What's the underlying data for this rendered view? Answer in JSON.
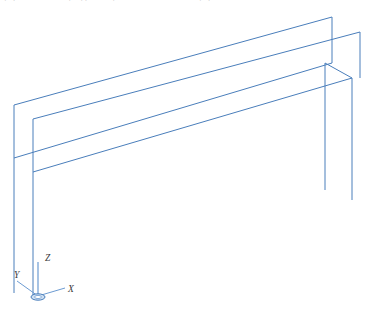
{
  "caption": {
    "text": "图 3-2   剪力墙结构的墙肢及连梁计算简图"
  },
  "viewport": {
    "background_color": "#ffffff",
    "line_color": "#4a7ebb",
    "line_color_dark": "#3f6fae",
    "line_width": 1
  },
  "axis_triad": {
    "origin": {
      "x": 38,
      "y": 296
    },
    "labels": [
      {
        "name": "x-axis-label",
        "text": "X",
        "x": 68,
        "y": 292
      },
      {
        "name": "y-axis-label",
        "text": "Y",
        "x": 16,
        "y": 277
      },
      {
        "name": "z-axis-label",
        "text": "Z",
        "x": 46,
        "y": 260
      }
    ],
    "marker_color": "#4a7ebb",
    "arms": [
      {
        "name": "x-arm",
        "x1": 38,
        "y1": 296,
        "x2": 65,
        "y2": 288
      },
      {
        "name": "y-arm",
        "x1": 38,
        "y1": 296,
        "x2": 17,
        "y2": 281
      },
      {
        "name": "z-arm",
        "x1": 38,
        "y1": 296,
        "x2": 38,
        "y2": 262
      }
    ]
  },
  "model": {
    "name": "shear-wall-wireframe",
    "description": "isometric wireframe of a long thin wall panel",
    "polylines": [
      {
        "name": "outer-panel-outline",
        "points": "14,105 332,17 332,63 352,78 352,200"
      },
      {
        "name": "outer-top-back-edge",
        "points": "14,105 14,158 332,63"
      },
      {
        "name": "inner-panel-top-edge",
        "points": "33,119 360,32 360,78"
      },
      {
        "name": "inner-panel-front",
        "points": "33,119 33,172 352,78"
      },
      {
        "name": "left-outer-vertical",
        "points": "14,158 14,293"
      },
      {
        "name": "left-inner-vertical",
        "points": "33,172 33,296"
      },
      {
        "name": "left-bottom-edge",
        "points": "14,293 33,296"
      },
      {
        "name": "bottom-front-edge",
        "points": "33,172 352,78"
      },
      {
        "name": "right-inner-vertical",
        "points": "325,63 325,190"
      },
      {
        "name": "right-outer-vertical",
        "points": "352,78 352,200"
      },
      {
        "name": "right-cap-edge",
        "points": "325,63 352,78"
      }
    ]
  }
}
